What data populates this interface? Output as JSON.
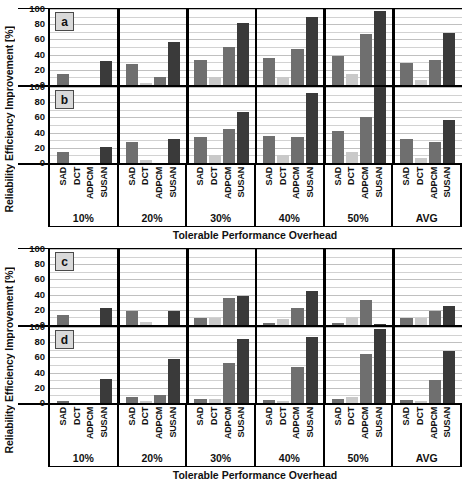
{
  "figure": {
    "ylabel": "Reliability Efficiency Improvement [%]",
    "xlabel": "Tolerable Performance Overhead"
  },
  "axis": {
    "yticks": [
      "100",
      "80",
      "60",
      "40",
      "20",
      "0"
    ],
    "benchmarks": [
      "SAD",
      "DCT",
      "ADPCM",
      "SUSAN"
    ],
    "groups": [
      "10%",
      "20%",
      "30%",
      "40%",
      "50%",
      "AVG"
    ]
  },
  "panels": [
    {
      "letter": "a"
    },
    {
      "letter": "b"
    },
    {
      "letter": "c"
    },
    {
      "letter": "d"
    }
  ],
  "colors": {
    "sad": "#6f6f6f",
    "dct": "#c9c9c9",
    "adpcm": "#6f6f6f",
    "susan": "#3a3a3a",
    "grid": "#d2d2d2",
    "axis": "#000000",
    "badge_bg": "#d9d9d9"
  },
  "chart_data": [
    {
      "type": "bar",
      "title": "a",
      "xlabel": "Tolerable Performance Overhead",
      "ylabel": "Reliability Efficiency Improvement [%]",
      "ylim": [
        0,
        100
      ],
      "grid": true,
      "categories": [
        "10%",
        "20%",
        "30%",
        "40%",
        "50%",
        "AVG"
      ],
      "series": [
        {
          "name": "SAD",
          "values": [
            14,
            27,
            33,
            35,
            38,
            29
          ]
        },
        {
          "name": "DCT",
          "values": [
            0,
            3,
            10,
            10,
            14,
            7
          ]
        },
        {
          "name": "ADPCM",
          "values": [
            0,
            10,
            50,
            47,
            67,
            33
          ]
        },
        {
          "name": "SUSAN",
          "values": [
            32,
            57,
            82,
            90,
            97,
            68
          ]
        }
      ]
    },
    {
      "type": "bar",
      "title": "b",
      "xlabel": "Tolerable Performance Overhead",
      "ylabel": "Reliability Efficiency Improvement [%]",
      "ylim": [
        0,
        100
      ],
      "grid": true,
      "categories": [
        "10%",
        "20%",
        "30%",
        "40%",
        "50%",
        "AVG"
      ],
      "series": [
        {
          "name": "SAD",
          "values": [
            15,
            28,
            34,
            36,
            42,
            31
          ]
        },
        {
          "name": "DCT",
          "values": [
            0,
            4,
            10,
            11,
            14,
            7
          ]
        },
        {
          "name": "ADPCM",
          "values": [
            0,
            0,
            45,
            34,
            60,
            27
          ]
        },
        {
          "name": "SUSAN",
          "values": [
            21,
            31,
            67,
            92,
            100,
            57
          ]
        }
      ]
    },
    {
      "type": "bar",
      "title": "c",
      "xlabel": "Tolerable Performance Overhead",
      "ylabel": "Reliability Efficiency Improvement [%]",
      "ylim": [
        0,
        100
      ],
      "grid": true,
      "categories": [
        "10%",
        "20%",
        "30%",
        "40%",
        "50%",
        "AVG"
      ],
      "series": [
        {
          "name": "SAD",
          "values": [
            13,
            18,
            9,
            2,
            3,
            9
          ]
        },
        {
          "name": "DCT",
          "values": [
            0,
            4,
            9,
            8,
            11,
            9
          ]
        },
        {
          "name": "ADPCM",
          "values": [
            0,
            0,
            36,
            23,
            33,
            18
          ]
        },
        {
          "name": "SUSAN",
          "values": [
            22,
            19,
            38,
            45,
            1,
            25
          ]
        }
      ]
    },
    {
      "type": "bar",
      "title": "d",
      "xlabel": "Tolerable Performance Overhead",
      "ylabel": "Reliability Efficiency Improvement [%]",
      "ylim": [
        0,
        100
      ],
      "grid": true,
      "categories": [
        "10%",
        "20%",
        "30%",
        "40%",
        "50%",
        "AVG"
      ],
      "series": [
        {
          "name": "SAD",
          "values": [
            2,
            8,
            5,
            4,
            5,
            4
          ]
        },
        {
          "name": "DCT",
          "values": [
            0,
            3,
            5,
            2,
            8,
            2
          ]
        },
        {
          "name": "ADPCM",
          "values": [
            0,
            11,
            52,
            47,
            65,
            30
          ]
        },
        {
          "name": "SUSAN",
          "values": [
            32,
            58,
            84,
            87,
            97,
            69
          ]
        }
      ]
    }
  ]
}
